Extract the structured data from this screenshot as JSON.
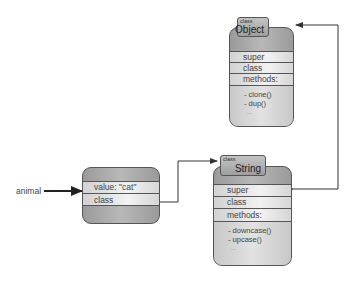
{
  "diagram": {
    "variable": {
      "name": "animal"
    },
    "instance": {
      "rows": [
        {
          "label": "value: \"cat\""
        },
        {
          "label": "class"
        }
      ]
    },
    "classes": [
      {
        "id": "string",
        "kind_label": "class",
        "name": "String",
        "rows": [
          {
            "label": "super"
          },
          {
            "label": "class"
          },
          {
            "label": "methods:"
          }
        ],
        "methods": [
          "- downcase()",
          "- upcase()"
        ],
        "ellipsis": "..."
      },
      {
        "id": "object",
        "kind_label": "class",
        "name": "Object",
        "rows": [
          {
            "label": "super"
          },
          {
            "label": "class"
          },
          {
            "label": "methods:"
          }
        ],
        "methods": [
          "- clone()",
          "- dup()"
        ],
        "ellipsis": "..."
      }
    ],
    "edges": [
      {
        "from": "animal",
        "to": "instance",
        "style": "thick-arrow"
      },
      {
        "from": "instance.class",
        "to": "String",
        "style": "elbow-arrow"
      },
      {
        "from": "String.super",
        "to": "Object",
        "style": "elbow-arrow"
      }
    ],
    "colors": {
      "line": "#333333",
      "box_fill": "#a8a8a8",
      "row_fill": "#e8e8e8"
    }
  }
}
